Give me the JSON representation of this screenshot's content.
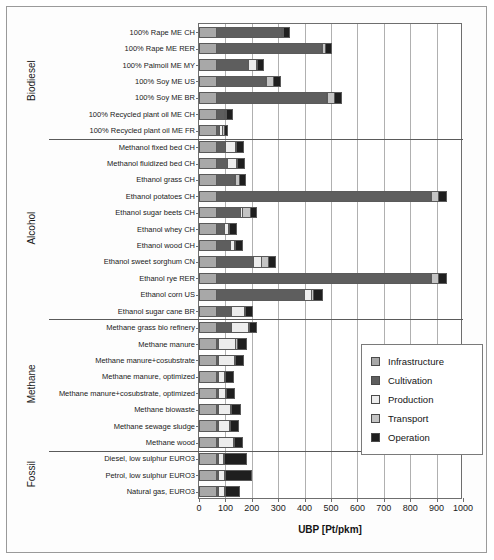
{
  "chart_data": {
    "type": "bar",
    "orientation": "horizontal",
    "stacked": true,
    "title": "",
    "xlabel": "UBP [Pt/pkm]",
    "ylabel": "",
    "xlim": [
      0,
      1000
    ],
    "xticks": [
      0,
      100,
      200,
      300,
      400,
      500,
      600,
      700,
      800,
      900,
      1000
    ],
    "grid": true,
    "legend_position": "center-right",
    "series": [
      {
        "name": "Infrastructure",
        "color": "#a8a8a8"
      },
      {
        "name": "Cultivation",
        "color": "#5e5e5e"
      },
      {
        "name": "Production",
        "color": "#ededed"
      },
      {
        "name": "Transport",
        "color": "#c4c4c4"
      },
      {
        "name": "Operation",
        "color": "#1f1f1f"
      }
    ],
    "groups": [
      {
        "label": "Biodiesel",
        "categories": [
          "100% Rape ME CH",
          "100% Rape ME RER",
          "100% Palmoil ME MY",
          "100% Soy ME US",
          "100% Soy ME BR",
          "100% Recycled plant oil ME CH",
          "100% Recycled plant oil ME FR"
        ],
        "values": [
          [
            70,
            245,
            4,
            4,
            22
          ],
          [
            70,
            395,
            4,
            14,
            22
          ],
          [
            70,
            120,
            28,
            4,
            26
          ],
          [
            70,
            185,
            4,
            26,
            24
          ],
          [
            70,
            415,
            4,
            28,
            26
          ],
          [
            70,
            28,
            4,
            4,
            22
          ],
          [
            70,
            10,
            10,
            8,
            12
          ]
        ]
      },
      {
        "label": "Alcohol",
        "categories": [
          "Methanol fixed bed CH",
          "Methanol fluidized bed CH",
          "Ethanol grass CH",
          "Ethanol potatoes CH",
          "Ethanol sugar beets CH",
          "Ethanol whey CH",
          "Ethanol wood CH",
          "Ethanol sweet sorghum  CN",
          "Ethanol rye RER",
          "Ethanol corn US",
          "Ethanol sugar cane BR"
        ],
        "values": [
          [
            70,
            32,
            38,
            4,
            26
          ],
          [
            70,
            38,
            36,
            4,
            28
          ],
          [
            70,
            68,
            4,
            14,
            24
          ],
          [
            70,
            810,
            4,
            24,
            30
          ],
          [
            70,
            88,
            10,
            28,
            24
          ],
          [
            70,
            30,
            14,
            4,
            26
          ],
          [
            70,
            50,
            16,
            4,
            28
          ],
          [
            70,
            140,
            30,
            24,
            26
          ],
          [
            70,
            810,
            4,
            24,
            32
          ],
          [
            70,
            330,
            28,
            8,
            32
          ],
          [
            70,
            56,
            50,
            4,
            26
          ]
        ]
      },
      {
        "label": "Methane",
        "categories": [
          "Methane grass bio refinery",
          "Methane manure",
          "Methane manure+cosubstrate",
          "Methane manure, optimized",
          "Methane manure+cosubstrate, optimized",
          "Methane biowaste",
          "Methane sewage sludge",
          "Methane wood"
        ],
        "values": [
          [
            70,
            56,
            62,
            4,
            26
          ],
          [
            70,
            4,
            68,
            4,
            36
          ],
          [
            70,
            4,
            62,
            4,
            32
          ],
          [
            70,
            4,
            26,
            4,
            28
          ],
          [
            70,
            4,
            30,
            4,
            28
          ],
          [
            70,
            4,
            48,
            4,
            32
          ],
          [
            70,
            4,
            42,
            4,
            30
          ],
          [
            70,
            4,
            60,
            4,
            30
          ]
        ]
      },
      {
        "label": "Fossil",
        "categories": [
          "Diesel, low sulphur EURO3",
          "Petrol, low sulphur EURO3",
          "Natural gas, EURO3"
        ],
        "values": [
          [
            70,
            4,
            22,
            4,
            82
          ],
          [
            70,
            4,
            26,
            4,
            96
          ],
          [
            70,
            4,
            24,
            4,
            54
          ]
        ]
      }
    ]
  },
  "axis": {
    "xlabel": "UBP [Pt/pkm]",
    "xticklabels": [
      "0",
      "100",
      "200",
      "300",
      "400",
      "500",
      "600",
      "700",
      "800",
      "900",
      "1000"
    ]
  },
  "legend": {
    "items": [
      {
        "label": "Infrastructure",
        "color": "#a8a8a8"
      },
      {
        "label": "Cultivation",
        "color": "#5e5e5e"
      },
      {
        "label": "Production",
        "color": "#ededed"
      },
      {
        "label": "Transport",
        "color": "#c4c4c4"
      },
      {
        "label": "Operation",
        "color": "#1f1f1f"
      }
    ]
  }
}
